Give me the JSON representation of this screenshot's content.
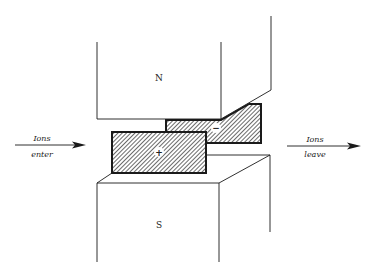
{
  "diagram": {
    "magnet_north_label": "N",
    "magnet_south_label": "S",
    "positive_electrode_label": "+",
    "negative_electrode_label": "−",
    "ions_enter": {
      "line1": "Ions",
      "line2": "enter"
    },
    "ions_leave": {
      "line1": "Ions",
      "line2": "leave"
    },
    "colors": {
      "stroke": "#1a1a1a",
      "hatch": "#1a1a1a",
      "background": "#ffffff"
    }
  }
}
